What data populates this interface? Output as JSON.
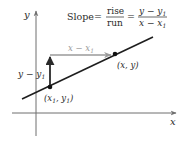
{
  "diagram": {
    "formula": {
      "lhs": "Slope",
      "equals": "=",
      "frac1": {
        "num": "rise",
        "den": "run"
      },
      "frac2": {
        "num_main": "y − y",
        "num_sub": "1",
        "den_main": "x − x",
        "den_sub": "1"
      }
    },
    "axes": {
      "x_label": "x",
      "y_label": "y"
    },
    "points": [
      {
        "id": "p1",
        "label_main": "(x",
        "label_sub1": "1",
        "label_mid": ", y",
        "label_sub2": "1",
        "label_end": ")"
      },
      {
        "id": "p2",
        "label": "(x, y)"
      }
    ],
    "run_label": {
      "main": "x − x",
      "sub": "1"
    },
    "rise_label": {
      "main": "y − y",
      "sub": "1"
    },
    "colors": {
      "line": "#1e1e1e",
      "axes": "#6e6e6e",
      "run_arrow": "#9a9a9a",
      "rise_arrow": "#2a2a2a",
      "point": "#111111",
      "text": "#2a2a2a",
      "run_text": "#9a9a9a"
    }
  }
}
